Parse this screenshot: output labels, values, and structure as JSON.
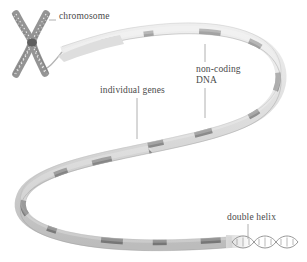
{
  "figure": {
    "background_color": "#ffffff",
    "text_color": "#4a4a4a",
    "ribbon_base_color": "#d9d9d9",
    "ribbon_band_color": "#8d8d8d",
    "ribbon_edge_color": "#b0b0b0",
    "chromosome_color": "#9a9a9a",
    "centromere_color": "#5a5a5a",
    "leader_line_color": "#9a9a9a"
  },
  "labels": {
    "chromosome": "chromosome",
    "individual_genes": "individual genes",
    "noncoding_dna_line1": "non-coding",
    "noncoding_dna_line2": "DNA",
    "double_helix": "double helix"
  },
  "structures": {
    "chromosome_name": "x-shaped-chromosome",
    "ribbon_name": "unwound-chromatin-ribbon",
    "helix_name": "dna-double-helix",
    "gene_band_count": 14,
    "helix_turn_count": 5
  }
}
